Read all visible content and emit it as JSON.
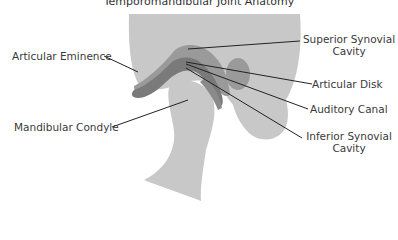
{
  "title": "Temporomandibular Joint Anatomy",
  "labels": {
    "articular_eminence": "Articular Eminence",
    "mandibular_condyle": "Mandibular Condyle",
    "superior_synovial_cavity_line1": "Superior Synovial",
    "superior_synovial_cavity_line2": "Cavity",
    "articular_disk": "Articular Disk",
    "auditory_canal": "Auditory Canal",
    "inferior_synovial_cavity_line1": "Inferior Synovial",
    "inferior_synovial_cavity_line2": "Cavity"
  },
  "colors": {
    "bone_light": "#c8c8c8",
    "tissue_mid": "#9a9a9a",
    "disk_dark": "#7a7a7a",
    "leader_line": "#222222",
    "text": "#3a3a3a"
  }
}
